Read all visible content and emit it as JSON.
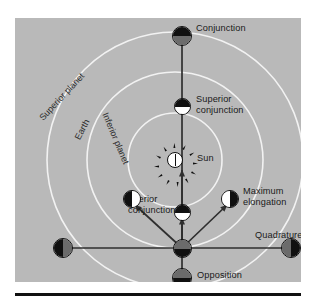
{
  "diagram": {
    "panel_color": "#b9b9b9",
    "orbit_color": "#f2f2f2",
    "line_color": "#2f2f2f",
    "text_color": "#1a1a1a",
    "center_body": {
      "name": "Sun",
      "label": "Sun",
      "fill": "#ffffff",
      "ray_count": 12
    },
    "orbits": [
      {
        "key": "inferior",
        "label": "Inferior planet",
        "radius": 47
      },
      {
        "key": "earth",
        "label": "Earth",
        "radius": 88
      },
      {
        "key": "superior",
        "label": "Superior planet",
        "radius": 128
      }
    ],
    "observer": {
      "name": "Earth",
      "top_half": "#6b6b6b",
      "bottom_half": "#101010"
    },
    "positions": [
      {
        "key": "conjunction",
        "label": "Conjunction",
        "orbit": "superior",
        "top_half": "#101010",
        "bottom_half": "#6b6b6b",
        "split": "horizontal"
      },
      {
        "key": "superior-conjunction",
        "label": "Superior conjunction",
        "label_line1": "Superior",
        "label_line2": "conjunction",
        "orbit": "inferior",
        "top_half": "#101010",
        "bottom_half": "#ffffff",
        "split": "horizontal"
      },
      {
        "key": "inferior-conjunction",
        "label": "Inferior conjunction",
        "label_line1": "Inferior",
        "label_line2": "conjunction",
        "orbit": "inferior",
        "top_half": "#101010",
        "bottom_half": "#ffffff",
        "split": "horizontal"
      },
      {
        "key": "maximum-elongation-west",
        "label": "Maximum elongation",
        "orbit": "inferior",
        "left_half": "#101010",
        "right_half": "#ffffff",
        "split": "vertical"
      },
      {
        "key": "maximum-elongation-east",
        "label": "Maximum elongation",
        "label_line1": "Maximum",
        "label_line2": "elongation",
        "orbit": "inferior",
        "left_half": "#ffffff",
        "right_half": "#101010",
        "split": "vertical"
      },
      {
        "key": "quadrature-east",
        "label": "Quadrature",
        "orbit": "superior",
        "left_half": "#6b6b6b",
        "right_half": "#101010",
        "split": "vertical"
      },
      {
        "key": "quadrature-west",
        "label": "Quadrature",
        "orbit": "superior",
        "left_half": "#101010",
        "right_half": "#6b6b6b",
        "split": "vertical"
      },
      {
        "key": "opposition",
        "label": "Opposition",
        "orbit": "superior",
        "top_half": "#6b6b6b",
        "bottom_half": "#101010",
        "split": "horizontal"
      }
    ]
  }
}
